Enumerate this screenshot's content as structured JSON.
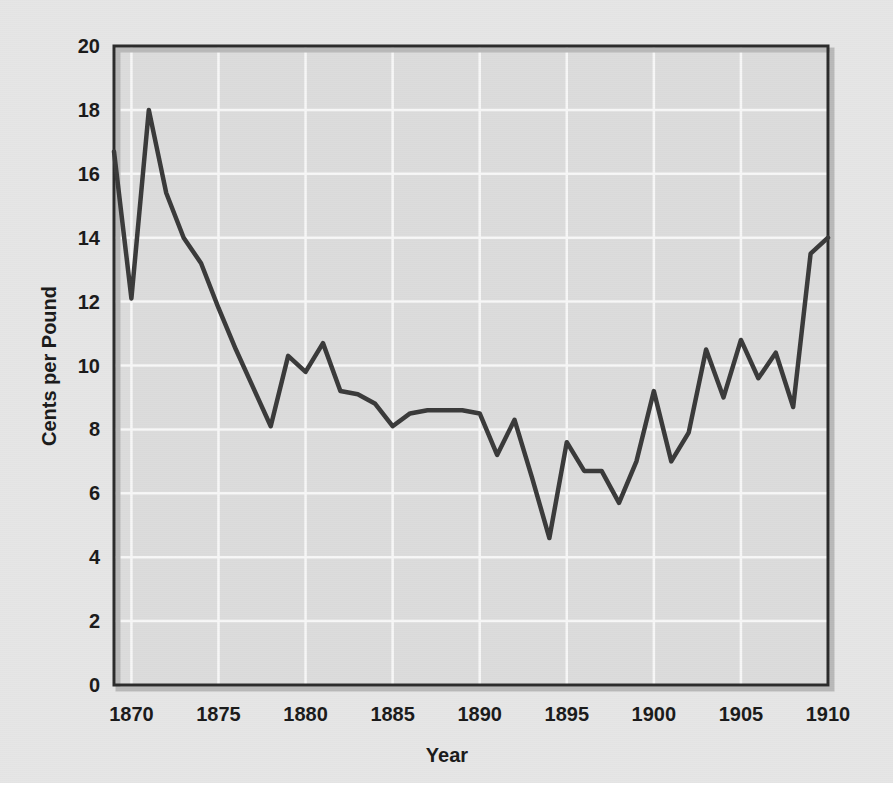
{
  "chart_data": {
    "type": "line",
    "title": "",
    "xlabel": "Year",
    "ylabel": "Cents per Pound",
    "xlim": [
      1869,
      1910
    ],
    "ylim": [
      0,
      20
    ],
    "xticks": [
      1870,
      1875,
      1880,
      1885,
      1890,
      1895,
      1900,
      1905,
      1910
    ],
    "xtick_labels": [
      "1870",
      "1875",
      "1880",
      "1885",
      "1890",
      "1895",
      "1900",
      "1905",
      "1910"
    ],
    "yticks": [
      0,
      2,
      4,
      6,
      8,
      10,
      12,
      14,
      16,
      18,
      20
    ],
    "ytick_labels": [
      "0",
      "2",
      "4",
      "6",
      "8",
      "10",
      "12",
      "14",
      "16",
      "18",
      "20"
    ],
    "grid": true,
    "grid_color": "#f7f7f7",
    "legend": null,
    "line_color": "#3a3a3a",
    "line_width": 4,
    "plot_background": "#dcdcdc",
    "frame_color": "#2b2b2b",
    "x": [
      1869,
      1870,
      1871,
      1872,
      1873,
      1874,
      1875,
      1876,
      1877,
      1878,
      1879,
      1880,
      1881,
      1882,
      1883,
      1884,
      1885,
      1886,
      1887,
      1888,
      1889,
      1890,
      1891,
      1892,
      1893,
      1894,
      1895,
      1896,
      1897,
      1898,
      1899,
      1900,
      1901,
      1902,
      1903,
      1904,
      1905,
      1906,
      1907,
      1908,
      1909,
      1910
    ],
    "values": [
      16.7,
      12.1,
      18.0,
      15.4,
      14.0,
      13.2,
      11.8,
      10.5,
      9.3,
      8.1,
      10.3,
      9.8,
      10.7,
      9.2,
      9.1,
      8.8,
      8.1,
      8.5,
      8.6,
      8.6,
      8.6,
      8.5,
      7.2,
      8.3,
      6.5,
      4.6,
      7.6,
      6.7,
      6.7,
      5.7,
      7.0,
      9.2,
      7.0,
      7.9,
      10.5,
      9.0,
      10.8,
      9.6,
      10.4,
      8.7,
      13.5,
      14.0
    ],
    "series_name": "Cotton price"
  },
  "axes": {
    "x_axis_title": "Year",
    "y_axis_title": "Cents per Pound"
  }
}
